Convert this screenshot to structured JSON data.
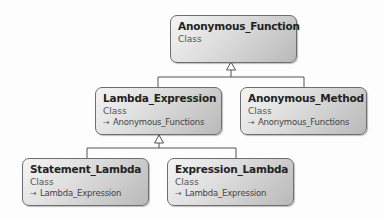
{
  "diagram": {
    "type": "class-inheritance",
    "nodes": [
      {
        "id": "anonymous_function",
        "name": "Anonymous_Function",
        "kind": "Class",
        "inherits": null
      },
      {
        "id": "lambda_expression",
        "name": "Lambda_Expression",
        "kind": "Class",
        "inherits": "Anonymous_Functions"
      },
      {
        "id": "anonymous_method",
        "name": "Anonymous_Method",
        "kind": "Class",
        "inherits": "Anonymous_Functions"
      },
      {
        "id": "statement_lambda",
        "name": "Statement_Lambda",
        "kind": "Class",
        "inherits": "Lambda_Expression"
      },
      {
        "id": "expression_lambda",
        "name": "Expression_Lambda",
        "kind": "Class",
        "inherits": "Lambda_Expression"
      }
    ],
    "edges": [
      {
        "from": "lambda_expression",
        "to": "anonymous_function",
        "type": "generalization"
      },
      {
        "from": "anonymous_method",
        "to": "anonymous_function",
        "type": "generalization"
      },
      {
        "from": "statement_lambda",
        "to": "lambda_expression",
        "type": "generalization"
      },
      {
        "from": "expression_lambda",
        "to": "lambda_expression",
        "type": "generalization"
      }
    ],
    "inherit_icon": "inheritance-arrow-icon",
    "colors": {
      "box_border": "#6e6e6e",
      "box_fill_light": "#f4f4f4",
      "box_fill_dark": "#b9b9b9",
      "line": "#555555"
    }
  }
}
